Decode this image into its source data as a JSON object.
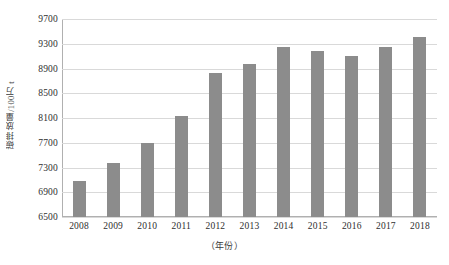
{
  "chart_data": {
    "type": "bar",
    "title": "",
    "subtitle": "",
    "xlabel": "（年份）",
    "ylabel": "碳排放量/100万 t",
    "categories": [
      "2008",
      "2009",
      "2010",
      "2011",
      "2012",
      "2013",
      "2014",
      "2015",
      "2016",
      "2017",
      "2018"
    ],
    "values": [
      7090,
      7370,
      7700,
      8130,
      8820,
      8980,
      9250,
      9180,
      9110,
      9240,
      9410
    ],
    "ylim": [
      6500,
      9700
    ],
    "ytick_step": 400,
    "yticks": [
      6500,
      6900,
      7300,
      7700,
      8100,
      8500,
      8900,
      9300,
      9700
    ],
    "ytick_labels": [
      "6500",
      "6900",
      "7300",
      "7700",
      "8100",
      "8500",
      "8900",
      "9300",
      "9700"
    ],
    "grid": true,
    "grid_axis": "y",
    "legend": false,
    "legend_position": "none",
    "series": [
      {
        "name": "碳排放量",
        "values": [
          7090,
          7370,
          7700,
          8130,
          8820,
          8980,
          9250,
          9180,
          9110,
          9240,
          9410
        ]
      }
    ],
    "colors": {
      "bar": "#8c8c8c",
      "gridline": "#d9d9d9",
      "axis": "#b0b0b0",
      "text": "#2e2e2e",
      "background": "#ffffff"
    }
  }
}
